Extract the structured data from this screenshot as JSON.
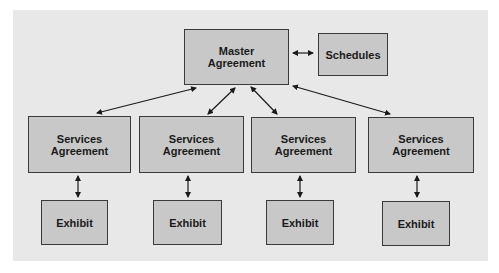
{
  "diagram": {
    "nodes": {
      "master": {
        "label_line1": "Master",
        "label_line2": "Agreement"
      },
      "schedules": {
        "label": "Schedules"
      },
      "services": [
        {
          "label_line1": "Services",
          "label_line2": "Agreement"
        },
        {
          "label_line1": "Services",
          "label_line2": "Agreement"
        },
        {
          "label_line1": "Services",
          "label_line2": "Agreement"
        },
        {
          "label_line1": "Services",
          "label_line2": "Agreement"
        }
      ],
      "exhibits": [
        {
          "label": "Exhibit"
        },
        {
          "label": "Exhibit"
        },
        {
          "label": "Exhibit"
        },
        {
          "label": "Exhibit"
        }
      ]
    },
    "edges": [
      {
        "from": "master",
        "to": "schedules",
        "type": "bidirectional"
      },
      {
        "from": "master",
        "to": "services.0",
        "type": "bidirectional"
      },
      {
        "from": "master",
        "to": "services.1",
        "type": "bidirectional"
      },
      {
        "from": "master",
        "to": "services.2",
        "type": "bidirectional"
      },
      {
        "from": "master",
        "to": "services.3",
        "type": "bidirectional"
      },
      {
        "from": "services.0",
        "to": "exhibits.0",
        "type": "bidirectional"
      },
      {
        "from": "services.1",
        "to": "exhibits.1",
        "type": "bidirectional"
      },
      {
        "from": "services.2",
        "to": "exhibits.2",
        "type": "bidirectional"
      },
      {
        "from": "services.3",
        "to": "exhibits.3",
        "type": "bidirectional"
      }
    ],
    "colors": {
      "background": "#e8e8e8",
      "box_fill": "#c8c8c8",
      "border": "#3a3a3a"
    }
  }
}
